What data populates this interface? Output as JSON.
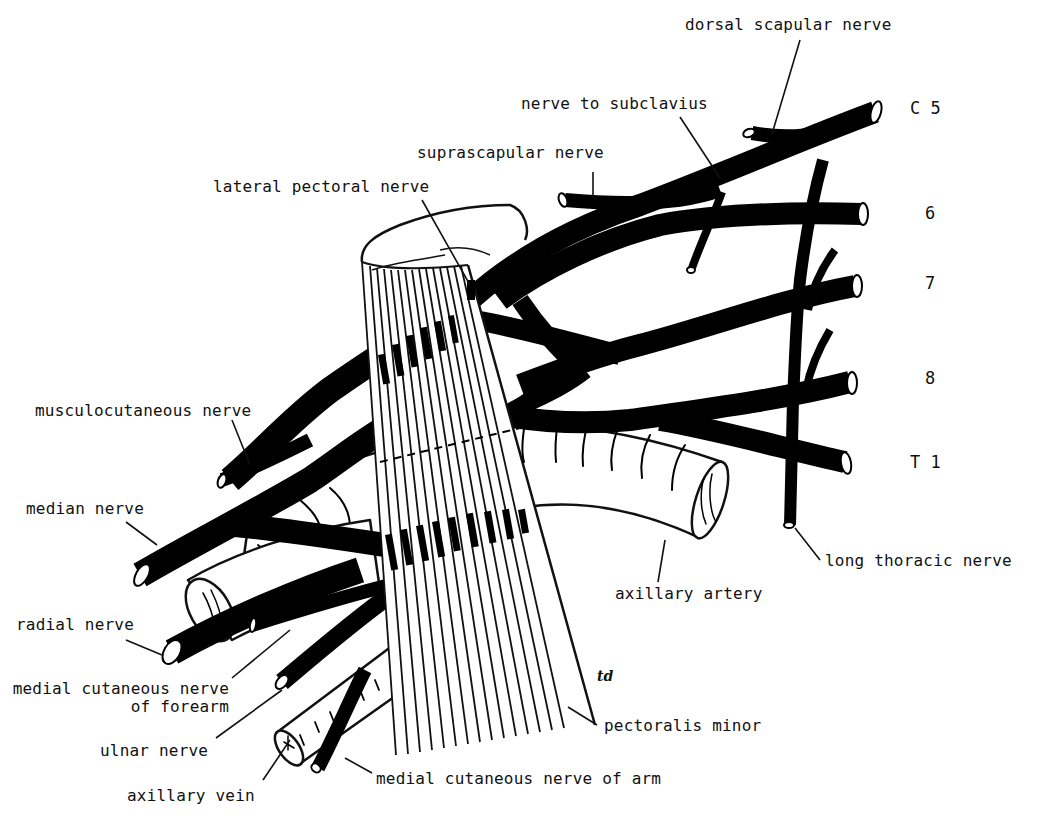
{
  "figure": {
    "colors": {
      "nerve": "#000000",
      "outline": "#111111",
      "background": "#ffffff"
    },
    "roots": [
      {
        "id": "c5",
        "label": "C 5"
      },
      {
        "id": "c6",
        "label": "6"
      },
      {
        "id": "c7",
        "label": "7"
      },
      {
        "id": "c8",
        "label": "8"
      },
      {
        "id": "t1",
        "label": "T 1"
      }
    ],
    "labels": {
      "dorsal_scapular": "dorsal scapular nerve",
      "nerve_to_subclavius": "nerve to subclavius",
      "suprascapular": "suprascapular nerve",
      "lateral_pectoral": "lateral pectoral nerve",
      "musculocutaneous": "musculocutaneous nerve",
      "median": "median nerve",
      "radial": "radial nerve",
      "medial_cutaneous_forearm_line1": "medial cutaneous nerve",
      "medial_cutaneous_forearm_line2": "of forearm",
      "ulnar": "ulnar nerve",
      "axillary_vein": "axillary vein",
      "medial_cutaneous_arm": "medial cutaneous nerve of arm",
      "pectoralis_minor": "pectoralis minor",
      "axillary_artery": "axillary artery",
      "long_thoracic": "long thoracic nerve"
    },
    "signature": "td"
  }
}
